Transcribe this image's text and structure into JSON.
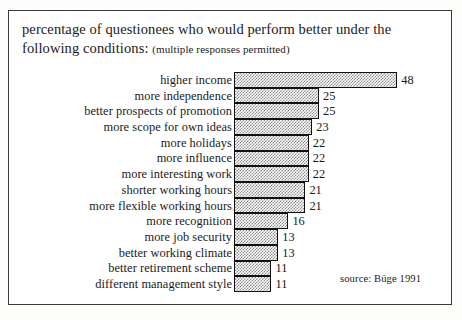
{
  "frame": {
    "border_color": "#3a3a3a",
    "background": "#ffffff"
  },
  "title": {
    "line1": "percentage of questionees who would perform better under the",
    "line2_main": "following conditions:",
    "line2_note": "(multiple responses permitted)"
  },
  "source": {
    "text": "source: Büge 1991"
  },
  "chart_data": {
    "type": "bar",
    "orientation": "horizontal",
    "title": "percentage of questionees who would perform better under the following conditions: (multiple responses permitted)",
    "subtitle": "(multiple responses permitted)",
    "xlabel": "",
    "ylabel": "",
    "xlim": [
      0,
      48
    ],
    "grid": false,
    "legend": false,
    "value_labels": true,
    "unit": "percent",
    "annotations": [
      "source: Büge 1991"
    ],
    "bar_fill": "#8c8c8c",
    "bar_edge": "#111111",
    "categories": [
      "higher income",
      "more independence",
      "better prospects of promotion",
      "more scope for own ideas",
      "more holidays",
      "more influence",
      "more interesting work",
      "shorter working hours",
      "more flexible working hours",
      "more recognition",
      "more job security",
      "better working climate",
      "better retirement scheme",
      "different management style"
    ],
    "values": [
      48,
      25,
      25,
      23,
      22,
      22,
      22,
      21,
      21,
      16,
      13,
      13,
      11,
      11
    ]
  }
}
